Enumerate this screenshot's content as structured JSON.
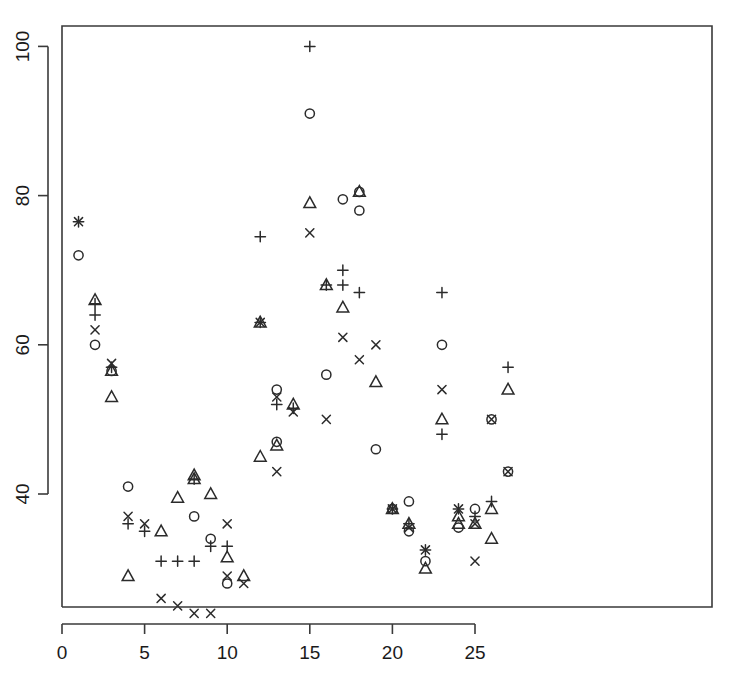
{
  "chart_data": {
    "type": "scatter",
    "title": "",
    "xlabel": "",
    "ylabel": "",
    "xlim": [
      0,
      28.7
    ],
    "ylim": [
      22,
      103
    ],
    "grid": false,
    "legend": "none",
    "xticks": [
      0,
      5,
      10,
      15,
      20,
      25
    ],
    "xtick_labels": [
      "0",
      "5",
      "10",
      "15",
      "20",
      "25"
    ],
    "yticks": [
      40,
      60,
      80,
      100
    ],
    "ytick_labels": [
      "40",
      "60",
      "80",
      "100"
    ],
    "marker_shapes": [
      "circle",
      "triangle",
      "plus",
      "cross"
    ],
    "series": [
      {
        "name": "circle",
        "marker": "circle",
        "points": [
          [
            1,
            72
          ],
          [
            2,
            60
          ],
          [
            3,
            56.5
          ],
          [
            4,
            41
          ],
          [
            8,
            37
          ],
          [
            9,
            34
          ],
          [
            10,
            28
          ],
          [
            13,
            54
          ],
          [
            13,
            47
          ],
          [
            15,
            91
          ],
          [
            16,
            56
          ],
          [
            17,
            79.5
          ],
          [
            18,
            80.5
          ],
          [
            18,
            78
          ],
          [
            19,
            46
          ],
          [
            20,
            38
          ],
          [
            21,
            39
          ],
          [
            21,
            35
          ],
          [
            22,
            31
          ],
          [
            23,
            60
          ],
          [
            24,
            35.5
          ],
          [
            25,
            38
          ],
          [
            26,
            50
          ],
          [
            27,
            43
          ]
        ]
      },
      {
        "name": "triangle",
        "marker": "triangle",
        "points": [
          [
            2,
            66
          ],
          [
            3,
            56.5
          ],
          [
            3,
            53
          ],
          [
            4,
            29
          ],
          [
            6,
            35
          ],
          [
            7,
            39.5
          ],
          [
            8,
            42.5
          ],
          [
            8,
            42
          ],
          [
            9,
            40
          ],
          [
            10,
            31.5
          ],
          [
            11,
            29
          ],
          [
            12,
            45
          ],
          [
            12,
            63
          ],
          [
            13,
            46.5
          ],
          [
            14,
            52
          ],
          [
            15,
            79
          ],
          [
            16,
            68
          ],
          [
            17,
            65
          ],
          [
            18,
            80.5
          ],
          [
            19,
            55
          ],
          [
            20,
            38
          ],
          [
            21,
            36
          ],
          [
            22,
            30
          ],
          [
            23,
            50
          ],
          [
            24,
            37
          ],
          [
            24,
            36
          ],
          [
            25,
            36
          ],
          [
            26,
            38
          ],
          [
            26,
            34
          ],
          [
            27,
            54
          ]
        ]
      },
      {
        "name": "plus",
        "marker": "plus",
        "points": [
          [
            1,
            76.5
          ],
          [
            2,
            64
          ],
          [
            2,
            65.5
          ],
          [
            3,
            57
          ],
          [
            4,
            36
          ],
          [
            5,
            35
          ],
          [
            6,
            31
          ],
          [
            7,
            31
          ],
          [
            8,
            31
          ],
          [
            8,
            42
          ],
          [
            9,
            33
          ],
          [
            10,
            33
          ],
          [
            12,
            63
          ],
          [
            12,
            74.5
          ],
          [
            13,
            52
          ],
          [
            14,
            51.5
          ],
          [
            15,
            100
          ],
          [
            16,
            68
          ],
          [
            17,
            70
          ],
          [
            17,
            68
          ],
          [
            18,
            67
          ],
          [
            20,
            38
          ],
          [
            21,
            36
          ],
          [
            22,
            32.5
          ],
          [
            23,
            67
          ],
          [
            23,
            48
          ],
          [
            24,
            38
          ],
          [
            25,
            37
          ],
          [
            26,
            39
          ],
          [
            27,
            57
          ]
        ]
      },
      {
        "name": "cross",
        "marker": "cross",
        "points": [
          [
            1,
            76.5
          ],
          [
            2,
            62
          ],
          [
            3,
            57.5
          ],
          [
            4,
            37
          ],
          [
            5,
            36
          ],
          [
            6,
            26
          ],
          [
            7,
            25
          ],
          [
            8,
            24
          ],
          [
            9,
            24
          ],
          [
            10,
            36
          ],
          [
            10,
            29
          ],
          [
            11,
            28
          ],
          [
            12,
            63
          ],
          [
            13,
            53
          ],
          [
            13,
            43
          ],
          [
            14,
            51
          ],
          [
            15,
            75
          ],
          [
            16,
            50
          ],
          [
            17,
            61
          ],
          [
            18,
            58
          ],
          [
            19,
            60
          ],
          [
            20,
            38
          ],
          [
            21,
            35.5
          ],
          [
            22,
            32.5
          ],
          [
            23,
            54
          ],
          [
            24,
            38
          ],
          [
            25,
            36
          ],
          [
            25,
            31
          ],
          [
            26,
            50
          ],
          [
            27,
            43
          ]
        ]
      }
    ]
  },
  "axis": {
    "x_tick_label_0": "0",
    "x_tick_label_1": "5",
    "x_tick_label_2": "10",
    "x_tick_label_3": "15",
    "x_tick_label_4": "20",
    "x_tick_label_5": "25",
    "y_tick_label_0": "40",
    "y_tick_label_1": "60",
    "y_tick_label_2": "80",
    "y_tick_label_3": "100"
  },
  "colors": {
    "marker": "#2b2b2b",
    "axis": "#3a3a3a",
    "background": "#ffffff",
    "text": "#1a1a1a"
  }
}
